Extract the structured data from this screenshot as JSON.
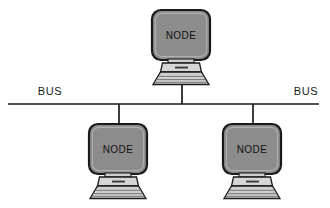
{
  "diagram": {
    "type": "network-topology",
    "topology_name": "bus",
    "background_color": "#ffffff",
    "width": 330,
    "height": 208,
    "bus": {
      "label_left": "BUS",
      "label_right": "BUS",
      "line_color": "#1a1a1a",
      "line_y": 104,
      "line_x_start": 8,
      "line_x_end": 319,
      "label_left_x": 50,
      "label_right_x": 306,
      "label_y": 95
    },
    "nodes": [
      {
        "id": "node-top",
        "label": "NODE",
        "position": "top-center",
        "monitor_x": 152,
        "monitor_y": 10,
        "monitor_w": 58,
        "monitor_h": 50,
        "drop_x": 182,
        "drop_from_y": 104,
        "drop_to_y": 83
      },
      {
        "id": "node-bottom-left",
        "label": "NODE",
        "position": "bottom-left",
        "monitor_x": 89,
        "monitor_y": 124,
        "monitor_w": 58,
        "monitor_h": 50,
        "drop_x": 119,
        "drop_from_y": 104,
        "drop_to_y": 126
      },
      {
        "id": "node-bottom-right",
        "label": "NODE",
        "position": "bottom-right",
        "monitor_x": 223,
        "monitor_y": 124,
        "monitor_w": 58,
        "monitor_h": 50,
        "drop_x": 253,
        "drop_from_y": 104,
        "drop_to_y": 126
      }
    ],
    "colors": {
      "screen_fill": "#8c8c8c",
      "screen_bezel_highlight": "#a8a8a8",
      "outline": "#1a1a1a",
      "keyboard_fill": "#d6d6d6",
      "keyboard_top_fill": "#bdbdbd",
      "base_fill": "#cfcfcf",
      "base_line": "#707070",
      "keyboard_dash": "#3a3a3a",
      "line_color": "#1a1a1a"
    }
  }
}
